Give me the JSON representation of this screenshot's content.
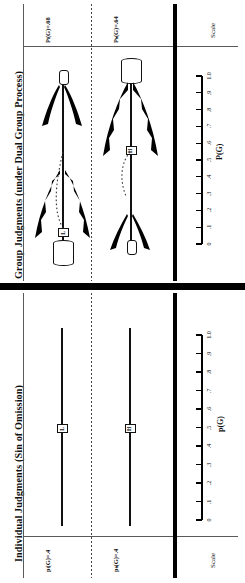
{
  "figure": {
    "panels": [
      {
        "id": "group",
        "title": "Group Judgments (under Dual Group Process)",
        "rows": [
          {
            "id": "group-low",
            "label": "Pₗ(G)=.08",
            "marker": "L",
            "value": 0.08
          },
          {
            "id": "group-high",
            "label": "Pₕ(G)=.64",
            "marker": "H",
            "value": 0.64
          }
        ],
        "scale": {
          "word": "Scale",
          "axis_title": "P(G)",
          "ticks": [
            "0",
            ".1",
            ".2",
            ".3",
            ".4",
            ".5",
            ".6",
            ".7",
            ".8",
            ".9",
            "1.0"
          ],
          "tick_values": [
            0,
            0.1,
            0.2,
            0.3,
            0.4,
            0.5,
            0.6,
            0.7,
            0.8,
            0.9,
            1.0
          ],
          "min": 0,
          "max": 1.0
        }
      },
      {
        "id": "individual",
        "title": "Individual Judgments (Sin of Omission)",
        "rows": [
          {
            "id": "ind-low",
            "label": "pₗ(G)=.4",
            "marker": "L",
            "value": 0.4
          },
          {
            "id": "ind-high",
            "label": "pₕ(G)=.4",
            "marker": "H",
            "value": 0.4
          }
        ],
        "scale": {
          "word": "Scale",
          "axis_title": "p(G)",
          "ticks": [
            "0",
            ".1",
            ".2",
            ".3",
            ".4",
            ".5",
            ".6",
            ".7",
            ".8",
            ".9",
            "1.0"
          ],
          "tick_values": [
            0,
            0.1,
            0.2,
            0.3,
            0.4,
            0.5,
            0.6,
            0.7,
            0.8,
            0.9,
            1.0
          ],
          "min": 0,
          "max": 1.0
        }
      }
    ]
  },
  "chart_data": {
    "type": "scatter",
    "xlabel": "",
    "ylabel": "P(G)",
    "xlim": [
      0,
      1.0
    ],
    "grid": false,
    "legend": "none",
    "categories": [
      "Pₗ(G)=.08",
      "Pₕ(G)=.64",
      "pₗ(G)=.4",
      "pₕ(G)=.4"
    ],
    "values": [
      0.08,
      0.64,
      0.4,
      0.4
    ],
    "series": [
      {
        "name": "Group Judgments (under Dual Group Process)",
        "points": [
          {
            "label": "Pₗ(G)=.08",
            "marker": "L",
            "value": 0.08
          },
          {
            "label": "Pₕ(G)=.64",
            "marker": "H",
            "value": 0.64
          }
        ]
      },
      {
        "name": "Individual Judgments (Sin of Omission)",
        "points": [
          {
            "label": "pₗ(G)=.4",
            "marker": "L",
            "value": 0.4
          },
          {
            "label": "pₕ(G)=.4",
            "marker": "H",
            "value": 0.4
          }
        ]
      }
    ],
    "axis_ticks": [
      "0",
      ".1",
      ".2",
      ".3",
      ".4",
      ".5",
      ".6",
      ".7",
      ".8",
      ".9",
      "1.0"
    ]
  },
  "colors": {
    "ink": "#111111",
    "rule": "#5a5a5a",
    "paper": "#ffffff"
  }
}
